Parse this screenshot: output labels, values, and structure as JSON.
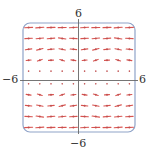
{
  "diagram": {
    "type": "slope-field",
    "labels": {
      "y_max": "6",
      "y_min": "−6",
      "x_min": "−6",
      "x_max": "6"
    },
    "range": {
      "x": [
        -6,
        6
      ],
      "y": [
        -6,
        6
      ]
    },
    "grid": {
      "cols": 10,
      "rows": 10
    },
    "colors": {
      "segment": "#d9534f",
      "dot": "#c05050",
      "axis": "#666666",
      "frame": "#8fa3c8",
      "label": "#333333"
    },
    "rows": [
      {
        "y": 5.5,
        "len": 8.0,
        "slopes": [
          0.05,
          0.08,
          0.03,
          0.02,
          0.06,
          0.06,
          0.02,
          0.03,
          0.08,
          0.05
        ]
      },
      {
        "y": 4.3,
        "len": 7.5,
        "slopes": [
          0.05,
          0.1,
          0.08,
          -0.15,
          -0.05,
          0.05,
          0.1,
          0.08,
          -0.15,
          -0.05
        ]
      },
      {
        "y": 3.1,
        "len": 6.5,
        "slopes": [
          0.15,
          0.25,
          0.1,
          -0.2,
          -0.1,
          0.15,
          0.25,
          0.1,
          -0.2,
          -0.1
        ]
      },
      {
        "y": 1.9,
        "len": 5.0,
        "slopes": [
          0.1,
          0.35,
          0.05,
          -0.3,
          -0.15,
          0.1,
          0.35,
          0.05,
          -0.3,
          -0.15
        ]
      },
      {
        "y": 0.7,
        "len": 1.5,
        "slopes": [
          0.0,
          0.5,
          0.0,
          -0.5,
          0.0,
          0.0,
          0.5,
          0.0,
          -0.5,
          0.0
        ]
      },
      {
        "y": -0.7,
        "len": 1.5,
        "slopes": [
          0.0,
          -0.5,
          0.0,
          0.5,
          0.0,
          0.0,
          -0.5,
          0.0,
          0.5,
          0.0
        ]
      },
      {
        "y": -1.9,
        "len": 5.0,
        "slopes": [
          -0.15,
          -0.3,
          0.05,
          0.35,
          0.1,
          -0.15,
          -0.3,
          0.05,
          0.35,
          0.1
        ]
      },
      {
        "y": -3.1,
        "len": 6.5,
        "slopes": [
          -0.1,
          -0.2,
          0.1,
          0.25,
          0.15,
          -0.1,
          -0.2,
          0.1,
          0.25,
          0.15
        ]
      },
      {
        "y": -4.3,
        "len": 7.5,
        "slopes": [
          -0.05,
          -0.15,
          0.08,
          0.1,
          0.05,
          -0.05,
          -0.15,
          0.08,
          0.1,
          0.05
        ]
      },
      {
        "y": -5.5,
        "len": 8.0,
        "slopes": [
          0.05,
          0.08,
          0.03,
          0.02,
          0.06,
          0.06,
          0.02,
          0.03,
          0.08,
          0.05
        ]
      }
    ]
  }
}
